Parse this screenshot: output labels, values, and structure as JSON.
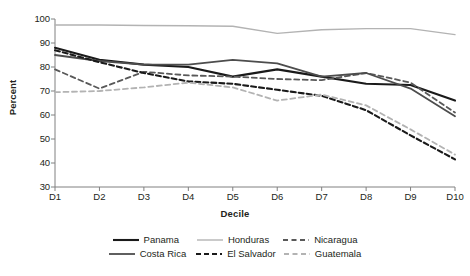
{
  "chart_data": {
    "type": "line",
    "title": "",
    "xlabel": "Decile",
    "ylabel": "Percent",
    "categories": [
      "D1",
      "D2",
      "D3",
      "D4",
      "D5",
      "D6",
      "D7",
      "D8",
      "D9",
      "D10"
    ],
    "ylim": [
      30,
      100
    ],
    "yticks": [
      30,
      40,
      50,
      60,
      70,
      80,
      90,
      100
    ],
    "grid": false,
    "legend_position": "bottom",
    "series": [
      {
        "name": "Panama",
        "style": "solid",
        "color": "#1a1a1a",
        "width": 2.1,
        "values": [
          88,
          83,
          81,
          80,
          76,
          79,
          76,
          73,
          72.5,
          66
        ]
      },
      {
        "name": "Honduras",
        "style": "solid",
        "color": "#b3b3b3",
        "width": 1.4,
        "values": [
          97.5,
          97.5,
          97.3,
          97.2,
          97,
          94,
          95.5,
          96,
          96,
          93.5
        ]
      },
      {
        "name": "Nicaragua",
        "style": "dashed",
        "color": "#595959",
        "width": 1.8,
        "values": [
          79,
          71,
          78,
          76.5,
          76,
          75,
          74.5,
          77.5,
          73.5,
          61
        ]
      },
      {
        "name": "Costa Rica",
        "style": "solid",
        "color": "#4d4d4d",
        "width": 1.8,
        "values": [
          85,
          82.5,
          81,
          81,
          83,
          81.5,
          76,
          77.5,
          71,
          59.5
        ]
      },
      {
        "name": "El Salvador",
        "style": "dashed",
        "color": "#1a1a1a",
        "width": 2.1,
        "values": [
          87,
          82,
          77.5,
          74,
          73,
          70.5,
          68,
          62,
          51.5,
          41.5
        ]
      },
      {
        "name": "Guatemala",
        "style": "dashed",
        "color": "#b3b3b3",
        "width": 1.8,
        "values": [
          69.5,
          70,
          71.5,
          73.5,
          71.5,
          66,
          68.5,
          64,
          54,
          43.5
        ]
      }
    ]
  },
  "axes": {
    "y_title": "Percent",
    "x_title": "Decile",
    "y_tick_labels": [
      "100",
      "90",
      "80",
      "70",
      "60",
      "50",
      "40",
      "30"
    ],
    "x_tick_labels": [
      "D1",
      "D2",
      "D3",
      "D4",
      "D5",
      "D6",
      "D7",
      "D8",
      "D9",
      "D10"
    ]
  },
  "legend": {
    "rows": [
      [
        {
          "label": "Panama",
          "series": 0
        },
        {
          "label": "Honduras",
          "series": 1
        },
        {
          "label": "Nicaragua",
          "series": 2
        }
      ],
      [
        {
          "label": "Costa Rica",
          "series": 3
        },
        {
          "label": "El Salvador",
          "series": 4
        },
        {
          "label": "Guatemala",
          "series": 5
        }
      ]
    ]
  },
  "colors": {
    "axis": "#808080",
    "text": "#231f20",
    "background": "#ffffff"
  }
}
